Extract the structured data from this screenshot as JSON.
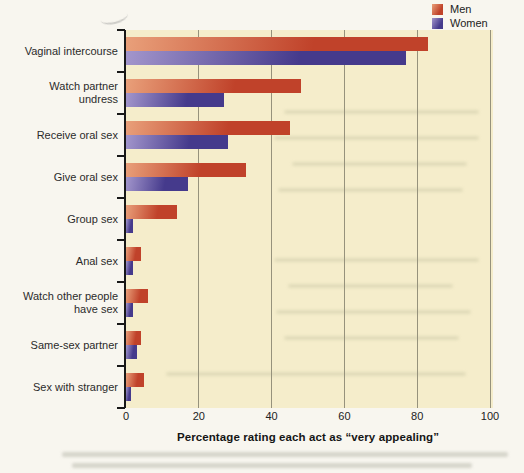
{
  "figure": {
    "kind": "scanned textbook bar chart",
    "colors": {
      "page_bg": "#f8f6ef",
      "plot_bg": "#f5edcb",
      "gridline": "#96927c",
      "men_light": "#e9a07a",
      "men_dark": "#c0422a",
      "women_light": "#a396cc",
      "women_dark": "#453a8c"
    }
  },
  "chart_data": {
    "type": "bar",
    "orientation": "horizontal",
    "title": "",
    "xlabel": "Percentage rating each act as “very appealing”",
    "ylabel": "",
    "xlim": [
      0,
      100
    ],
    "x_ticks": [
      0,
      20,
      40,
      60,
      80,
      100
    ],
    "grid": "vertical",
    "legend_position": "top-right",
    "categories": [
      "Vaginal intercourse",
      "Watch partner undress",
      "Receive oral sex",
      "Give oral sex",
      "Group sex",
      "Anal sex",
      "Watch other people have sex",
      "Same-sex partner",
      "Sex with stranger"
    ],
    "category_label_lines": [
      [
        "Vaginal intercourse"
      ],
      [
        "Watch partner",
        "undress"
      ],
      [
        "Receive oral sex"
      ],
      [
        "Give oral sex"
      ],
      [
        "Group sex"
      ],
      [
        "Anal sex"
      ],
      [
        "Watch other people",
        "have sex"
      ],
      [
        "Same-sex partner"
      ],
      [
        "Sex with stranger"
      ]
    ],
    "series": [
      {
        "name": "Men",
        "values": [
          83,
          48,
          45,
          33,
          14,
          4,
          6,
          4,
          5
        ]
      },
      {
        "name": "Women",
        "values": [
          77,
          27,
          28,
          17,
          2,
          2,
          2,
          3,
          1.5
        ]
      }
    ]
  }
}
